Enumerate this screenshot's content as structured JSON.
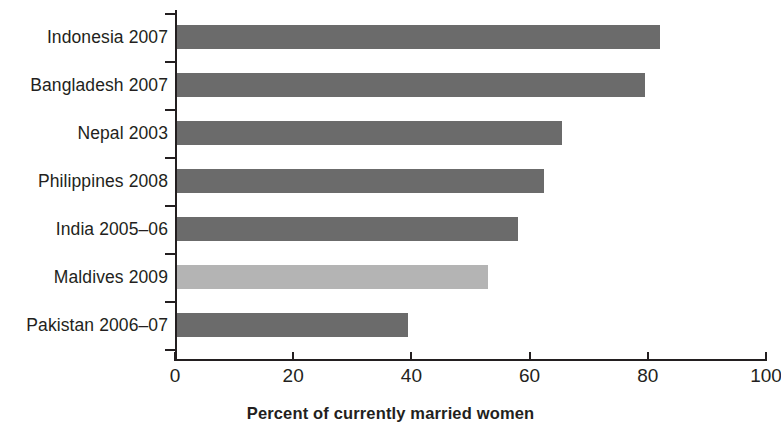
{
  "chart_data": {
    "type": "bar",
    "orientation": "horizontal",
    "title": "",
    "xlabel": "Percent of currently married women",
    "ylabel": "",
    "xlim": [
      0,
      100
    ],
    "xticks": [
      0,
      20,
      40,
      60,
      80,
      100
    ],
    "xtick_labels": [
      "0",
      "20",
      "40",
      "60",
      "80",
      "100"
    ],
    "grid": false,
    "legend": null,
    "categories": [
      "Indonesia 2007",
      "Bangladesh 2007",
      "Nepal 2003",
      "Philippines 2008",
      "India 2005–06",
      "Maldives 2009",
      "Pakistan 2006–07"
    ],
    "values": [
      82,
      79.5,
      65.5,
      62.5,
      58,
      53,
      39.5
    ],
    "bar_colors": [
      "#6b6b6b",
      "#6b6b6b",
      "#6b6b6b",
      "#6b6b6b",
      "#6b6b6b",
      "#b4b4b4",
      "#6b6b6b"
    ],
    "highlight_category": "Maldives 2009",
    "axis_color": "#231f20",
    "background_color": "#ffffff"
  }
}
